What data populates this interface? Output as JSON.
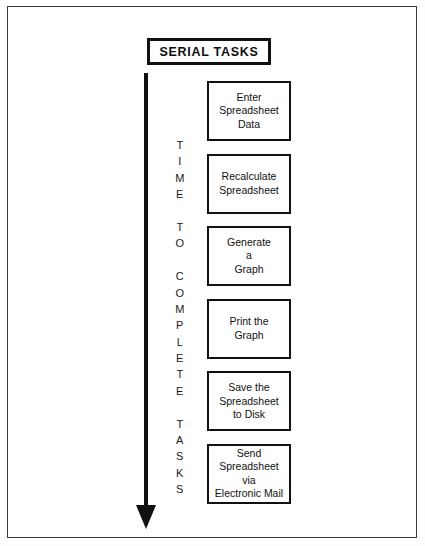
{
  "diagram": {
    "title": "SERIAL TASKS",
    "axis_label_text": "TIME TO COMPLETE TASKS",
    "axis_letters": [
      "T",
      "I",
      "M",
      "E",
      " ",
      "T",
      "O",
      " ",
      "C",
      "O",
      "M",
      "P",
      "L",
      "E",
      "T",
      "E",
      " ",
      "T",
      "A",
      "S",
      "K",
      "S"
    ],
    "arrow_direction": "down",
    "colors": {
      "frame": "#3a3a3a",
      "box_border": "#111111",
      "arrow": "#111111",
      "text": "#111111",
      "background": "#ffffff"
    },
    "tasks": [
      {
        "lines": [
          "Enter",
          "Spreadsheet",
          "Data"
        ]
      },
      {
        "lines": [
          "Recalculate",
          "Spreadsheet"
        ]
      },
      {
        "lines": [
          "Generate",
          "a",
          "Graph"
        ]
      },
      {
        "lines": [
          "Print the",
          "Graph"
        ]
      },
      {
        "lines": [
          "Save the",
          "Spreadsheet",
          "to Disk"
        ]
      },
      {
        "lines": [
          "Send",
          "Spreadsheet",
          "via",
          "Electronic Mail"
        ]
      }
    ]
  }
}
